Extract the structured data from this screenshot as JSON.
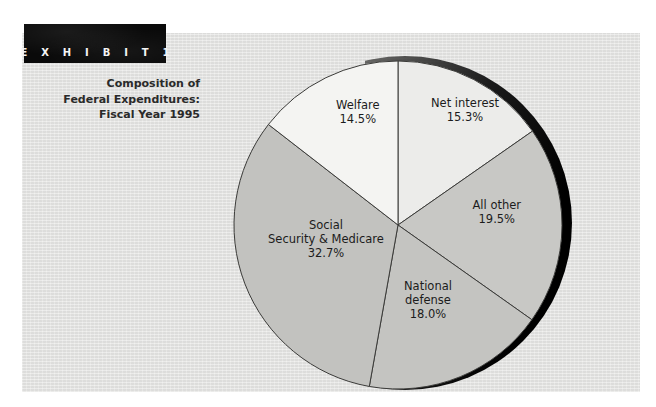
{
  "exhibit": {
    "banner_label": "E X H I B I T   1",
    "banner_color": "#0a0a0a",
    "title_lines": [
      "Composition of",
      "Federal Expenditures:",
      "Fiscal Year 1995"
    ]
  },
  "panel": {
    "background_color": "#e3e3e1"
  },
  "footer": {
    "source_text": ""
  },
  "chart_data": {
    "type": "pie",
    "title": "Composition of Federal Expenditures: Fiscal Year 1995",
    "subtitle": "",
    "xlabel": "",
    "ylabel": "",
    "legend_position": "none",
    "grid": false,
    "start_angle_deg": 0,
    "direction": "clockwise",
    "units": "percent",
    "categories": [
      "Net interest",
      "All other",
      "National defense",
      "Social Security & Medicare",
      "Welfare"
    ],
    "values": [
      15.3,
      19.5,
      18.0,
      32.7,
      14.5
    ],
    "slices": [
      {
        "label": "Net interest",
        "value": 15.3,
        "value_text": "15.3%",
        "color": "#ececeA",
        "label_lines": [
          "Net interest",
          "15.3%"
        ],
        "label_x": 465,
        "label_y": 110
      },
      {
        "label": "All other",
        "value": 19.5,
        "value_text": "19.5%",
        "color": "#c8c8c5",
        "label_lines": [
          "All other",
          "19.5%"
        ],
        "label_x": 497,
        "label_y": 212
      },
      {
        "label": "National defense",
        "value": 18.0,
        "value_text": "18.0%",
        "color": "#c4c4c1",
        "label_lines": [
          "National",
          "defense",
          "18.0%"
        ],
        "label_x": 428,
        "label_y": 300
      },
      {
        "label": "Social Security & Medicare",
        "value": 32.7,
        "value_text": "32.7%",
        "color": "#c2c2bf",
        "label_lines": [
          "Social",
          "Security & Medicare",
          "32.7%"
        ],
        "label_x": 326,
        "label_y": 239
      },
      {
        "label": "Welfare",
        "value": 14.5,
        "value_text": "14.5%",
        "color": "#f4f4f2",
        "label_lines": [
          "Welfare",
          "14.5%"
        ],
        "label_x": 358,
        "label_y": 112
      }
    ],
    "total": 100.0
  }
}
